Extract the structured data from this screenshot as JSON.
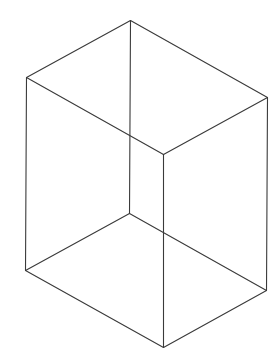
{
  "figure": {
    "type": "wireframe-box",
    "background": "#ffffff",
    "stroke_color": "#3a3a3a",
    "stroke_width": 1.1,
    "vertices": {
      "top_back": [
        130,
        20
      ],
      "top_left": [
        26,
        77
      ],
      "top_right": [
        267,
        97
      ],
      "top_front": [
        163,
        154
      ],
      "bottom_back": [
        129,
        213
      ],
      "bottom_left": [
        25,
        270
      ],
      "bottom_right": [
        266,
        290
      ],
      "bottom_front": [
        163,
        347
      ]
    },
    "edges": [
      [
        "top_back",
        "top_left"
      ],
      [
        "top_back",
        "top_right"
      ],
      [
        "top_left",
        "top_front"
      ],
      [
        "top_right",
        "top_front"
      ],
      [
        "bottom_back",
        "bottom_left"
      ],
      [
        "bottom_back",
        "bottom_right"
      ],
      [
        "bottom_left",
        "bottom_front"
      ],
      [
        "bottom_right",
        "bottom_front"
      ],
      [
        "top_back",
        "bottom_back"
      ],
      [
        "top_left",
        "bottom_left"
      ],
      [
        "top_right",
        "bottom_right"
      ],
      [
        "top_front",
        "bottom_front"
      ]
    ]
  }
}
